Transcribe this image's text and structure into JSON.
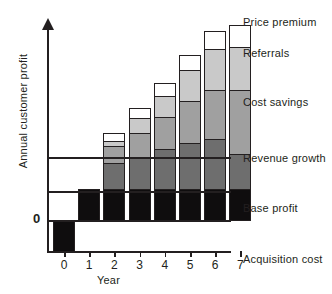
{
  "chart_data": {
    "type": "bar",
    "title": "",
    "subtitle": "",
    "xlabel": "Year",
    "ylabel": "Annual customer profit",
    "categories": [
      "0",
      "1",
      "2",
      "3",
      "4",
      "5",
      "6",
      "7"
    ],
    "stacked": true,
    "grid": false,
    "legend_position": "right",
    "annotations": [
      "0"
    ],
    "zero_label": "0",
    "ylim": [
      -22,
      106
    ],
    "axis_ticks_y": [
      "0"
    ],
    "series": [
      {
        "name": "Acquisition cost",
        "color": "#0f0d0e",
        "values": [
          -22,
          0,
          0,
          0,
          0,
          0,
          0,
          0
        ]
      },
      {
        "name": "Base profit",
        "color": "#0f0d0e",
        "values": [
          0,
          21,
          21,
          21,
          21,
          21,
          21,
          21
        ]
      },
      {
        "name": "Revenue growth",
        "color": "#6e6e6e",
        "values": [
          0,
          0,
          18,
          22,
          27,
          31,
          34,
          24
        ]
      },
      {
        "name": "Cost savings",
        "color": "#a0a0a0",
        "values": [
          0,
          0,
          11,
          16,
          22,
          29,
          33,
          43
        ]
      },
      {
        "name": "Referrals",
        "color": "#c9c9c9",
        "values": [
          0,
          0,
          4,
          10,
          14,
          21,
          28,
          29
        ]
      },
      {
        "name": "Price premium",
        "color": "#ffffff",
        "values": [
          0,
          0,
          5,
          7,
          9,
          10,
          12,
          15
        ]
      }
    ],
    "totals": [
      -22,
      21,
      59,
      76,
      93,
      112,
      128,
      132
    ]
  },
  "legend": {
    "items": [
      {
        "label": "Price premium"
      },
      {
        "label": "Referrals"
      },
      {
        "label": "Cost savings"
      },
      {
        "label": "Revenue growth"
      },
      {
        "label": "Base profit"
      },
      {
        "label": "Acquisition cost"
      }
    ]
  },
  "axis": {
    "x_ticks": [
      "0",
      "1",
      "2",
      "3",
      "4",
      "5",
      "6",
      "7"
    ],
    "x_title": "Year",
    "y_title": "Annual customer profit",
    "origin_label": "0"
  }
}
